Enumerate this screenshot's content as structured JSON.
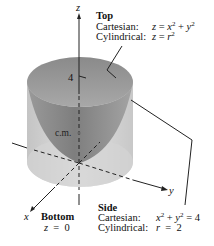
{
  "figure": {
    "axes": {
      "z": "z",
      "x": "x",
      "y": "y"
    },
    "tick_label": "4",
    "center_of_mass_label": "c.m.",
    "top": {
      "title": "Top",
      "cartesian_label": "Cartesian:",
      "cartesian_eq": {
        "lhs": "z",
        "op": "=",
        "a": "x",
        "exp_a": "2",
        "plus": "+",
        "b": "y",
        "exp_b": "2"
      },
      "cylindrical_label": "Cylindrical:",
      "cylindrical_eq": {
        "lhs": "z",
        "op": "=",
        "var": "r",
        "exp": "2"
      }
    },
    "bottom": {
      "title": "Bottom",
      "eq": {
        "lhs": "z",
        "op": "=",
        "rhs": "0"
      }
    },
    "side": {
      "title": "Side",
      "cartesian_label": "Cartesian:",
      "cartesian_eq": {
        "a": "x",
        "exp_a": "2",
        "plus": "+",
        "b": "y",
        "exp_b": "2",
        "op": "=",
        "rhs": "4"
      },
      "cylindrical_label": "Cylindrical:",
      "cylindrical_eq": {
        "lhs": "r",
        "op": "=",
        "rhs": "2"
      }
    },
    "colors": {
      "cylinder": "#d8d8d8",
      "paraboloid": "#8f8f8f",
      "rim": "#b0b0b0"
    }
  }
}
